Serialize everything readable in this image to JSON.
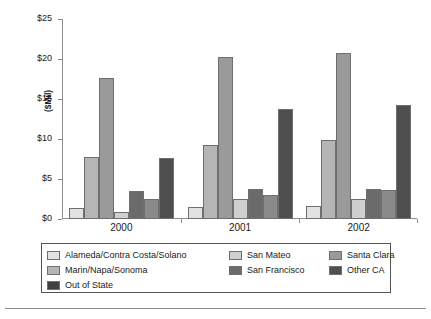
{
  "chart_data": {
    "type": "bar",
    "title": "",
    "subtitle": "",
    "xlabel": "",
    "ylabel": "($Mil)",
    "categories": [
      "2000",
      "2001",
      "2002"
    ],
    "ylim": [
      0,
      25
    ],
    "ytick_labels": [
      "$0",
      "$5",
      "$10",
      "$15",
      "$20",
      "$25"
    ],
    "ytick_values": [
      0,
      5,
      10,
      15,
      20,
      25
    ],
    "grid": false,
    "legend_position": "bottom",
    "units": "Millions of dollars",
    "series": [
      {
        "name": "Alameda/Contra Costa/Solano",
        "color": "#e2e2e2",
        "values": [
          1.4,
          1.5,
          1.6
        ]
      },
      {
        "name": "Marin/Napa/Sonoma",
        "color": "#b5b5b5",
        "values": [
          7.7,
          9.2,
          9.9
        ]
      },
      {
        "name": "Santa Clara",
        "color": "#9a9a9a",
        "values": [
          17.6,
          20.2,
          20.7
        ]
      },
      {
        "name": "San Mateo",
        "color": "#cfcfcf",
        "values": [
          0.9,
          2.5,
          2.5
        ]
      },
      {
        "name": "San Francisco",
        "color": "#6b6b6b",
        "values": [
          3.5,
          3.8,
          3.8
        ]
      },
      {
        "name": "Other CA",
        "color": "#8a8a8a",
        "values": [
          2.5,
          3.0,
          3.6
        ]
      },
      {
        "name": "Out of State",
        "color": "#4f4f4f",
        "values": [
          7.6,
          13.7,
          14.3
        ]
      }
    ]
  },
  "legend": {
    "items": [
      {
        "label": "Alameda/Contra Costa/Solano",
        "color": "#e2e2e2"
      },
      {
        "label": "San Mateo",
        "color": "#cfcfcf"
      },
      {
        "label": "Santa Clara",
        "color": "#9a9a9a"
      },
      {
        "label": "Marin/Napa/Sonoma",
        "color": "#b5b5b5"
      },
      {
        "label": "San Francisco",
        "color": "#6b6b6b"
      },
      {
        "label": "Other CA",
        "color": "#4f4f4f"
      },
      {
        "label": "Out of State",
        "color": "#3f3f3f"
      }
    ]
  }
}
